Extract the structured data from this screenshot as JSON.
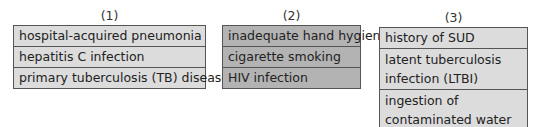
{
  "groups": [
    {
      "label": "(1)",
      "fill": "#dcdcdc",
      "items": [
        "hospital-acquired pneumonia",
        "hepatitis C infection",
        "primary tuberculosis (TB) disease"
      ]
    },
    {
      "label": "(2)",
      "fill": "#b3b3b3",
      "items": [
        "inadequate hand hygiene",
        "cigarette smoking",
        "HIV infection"
      ]
    },
    {
      "label": "(3)",
      "fill": "#dcdcdc",
      "items": [
        "history of SUD",
        "latent tuberculosis infection (LTBI)",
        "ingestion of contaminated water"
      ]
    }
  ]
}
